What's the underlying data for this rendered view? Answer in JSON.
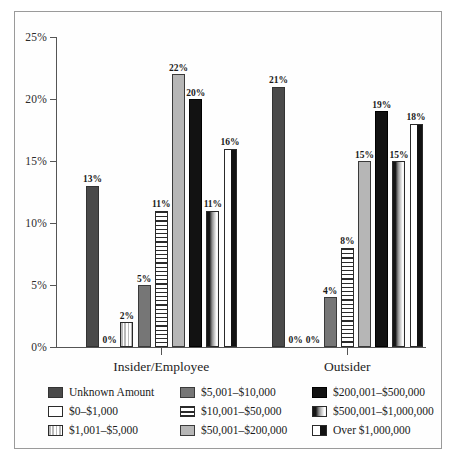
{
  "chart_data": {
    "type": "bar",
    "title": "",
    "xlabel": "",
    "ylabel": "",
    "ylim": [
      0,
      25
    ],
    "yticks": [
      "0%",
      "5%",
      "10%",
      "15%",
      "20%",
      "25%"
    ],
    "ytick_values": [
      0,
      5,
      10,
      15,
      20,
      25
    ],
    "grid": false,
    "legend_position": "bottom",
    "categories": [
      "Insider/Employee",
      "Outsider"
    ],
    "series": [
      {
        "name": "Unknown Amount",
        "pattern": "solid-dark-gray",
        "color": "#4a4a4a",
        "values": [
          13,
          21
        ]
      },
      {
        "name": "$0–$1,000",
        "pattern": "white",
        "color": "#ffffff",
        "values": [
          0,
          0
        ]
      },
      {
        "name": "$1,001–$5,000",
        "pattern": "vertical-stripes",
        "color": "#b9b9b9",
        "values": [
          2,
          0
        ]
      },
      {
        "name": "$5,001–$10,000",
        "pattern": "solid-medium-gray",
        "color": "#767676",
        "values": [
          5,
          4
        ]
      },
      {
        "name": "$10,001–$50,000",
        "pattern": "horizontal-stripes",
        "color": "#2a2a2a",
        "values": [
          11,
          8
        ]
      },
      {
        "name": "$50,001–$200,000",
        "pattern": "solid-light-gray",
        "color": "#b6b6b6",
        "values": [
          22,
          15
        ]
      },
      {
        "name": "$200,001–$500,000",
        "pattern": "solid-black",
        "color": "#121212",
        "values": [
          20,
          19
        ]
      },
      {
        "name": "$500,001–$1,000,000",
        "pattern": "split-dark-light",
        "color": "#151515",
        "values": [
          11,
          15
        ]
      },
      {
        "name": "Over $1,000,000",
        "pattern": "white-left-black-right",
        "color": "#121212",
        "values": [
          16,
          18
        ]
      }
    ],
    "data_labels": {
      "Insider/Employee": [
        "13%",
        "0%",
        "2%",
        "5%",
        "11%",
        "22%",
        "20%",
        "11%",
        "16%"
      ],
      "Outsider": [
        "21%",
        "0%",
        "0%",
        "4%",
        "8%",
        "15%",
        "19%",
        "15%",
        "18%"
      ]
    }
  },
  "legend": {
    "items": [
      {
        "label": "Unknown Amount",
        "swatch": "solid-dark-gray"
      },
      {
        "label": "$5,001–$10,000",
        "swatch": "solid-medium-gray"
      },
      {
        "label": "$200,001–$500,000",
        "swatch": "solid-black"
      },
      {
        "label": "$0–$1,000",
        "swatch": "white"
      },
      {
        "label": "$10,001–$50,000",
        "swatch": "horizontal-stripes"
      },
      {
        "label": "$500,001–$1,000,000",
        "swatch": "split-dark-light"
      },
      {
        "label": "$1,001–$5,000",
        "swatch": "vertical-stripes"
      },
      {
        "label": "$50,001–$200,000",
        "swatch": "solid-light-gray"
      },
      {
        "label": "Over $1,000,000",
        "swatch": "white-left-black-right"
      }
    ]
  },
  "colors": {
    "background": "#ffffff",
    "frame_border": "#9a9a9a",
    "axis": "#555555",
    "text": "#1a1a1a"
  }
}
